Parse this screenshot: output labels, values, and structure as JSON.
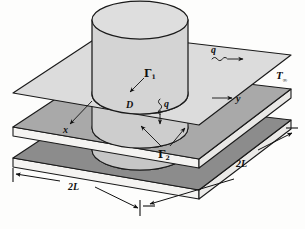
{
  "figure": {
    "type": "engineering-schematic"
  },
  "labels": {
    "gamma1": "Γ",
    "gamma1_sub": "1",
    "gamma2": "Γ",
    "gamma2_sub": "2",
    "diameter": "D",
    "axis_x": "x",
    "axis_y": "y",
    "heat_flux_side": "q",
    "heat_flux_down": "q",
    "ambient_temp": "T",
    "ambient_temp_sub": "∞",
    "dim_front": "2L",
    "dim_right": "2L"
  },
  "colors": {
    "plate_top": "#d9d9d9",
    "plate_middle": "#a8a8a8",
    "plate_bottom": "#8a8a8a",
    "plate_bottom_face": "#f2f2f0",
    "cylinder_body": "#cfcfcf",
    "cylinder_top": "#dcdcdc",
    "cylinder_lower": "#c4c4c4",
    "outline": "#1a1a1a",
    "background": "#fdfdfc",
    "text": "#101010"
  },
  "geometry": {
    "plate_count": 3,
    "plate_shape": "square-parallelogram-projection",
    "cylinder_diameter_label": "D",
    "plate_side_label": "2L"
  },
  "annotations": [
    {
      "name": "gamma1-boundary",
      "description": "upper boundary surface on top plate around cylinder"
    },
    {
      "name": "gamma2-boundary",
      "description": "lower boundary surfaces near bottom of cylinder"
    },
    {
      "name": "q-side-flux",
      "description": "horizontal heat flux arrow on top plate pointing right"
    },
    {
      "name": "q-down-flux",
      "description": "vertical heat flux arrow pointing down through plates"
    },
    {
      "name": "x-axis",
      "description": "coordinate axis arrow pointing down-left"
    },
    {
      "name": "y-axis",
      "description": "coordinate axis arrow pointing right"
    },
    {
      "name": "ambient-temperature",
      "description": "T-infinity label at right of figure"
    }
  ]
}
